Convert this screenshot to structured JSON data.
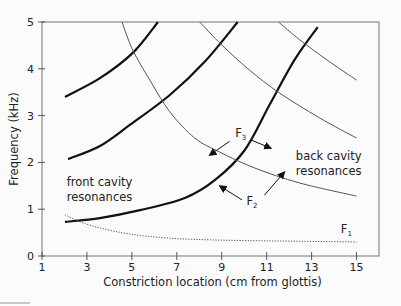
{
  "chart_data": {
    "type": "line",
    "title": "",
    "xlabel": "Constriction location (cm from glottis)",
    "ylabel": "Frequency (kHz)",
    "xlim": [
      1,
      16
    ],
    "ylim": [
      0,
      5
    ],
    "xticks": [
      1,
      3,
      5,
      7,
      9,
      11,
      13,
      15
    ],
    "yticks": [
      0,
      1,
      2,
      3,
      4,
      5
    ],
    "grid": false,
    "legend": null,
    "series": [
      {
        "name": "back cavity resonance 1 (F2 branch, heavy)",
        "style": "heavy",
        "x": [
          2.02,
          3.58,
          5.36,
          7.36,
          8.69,
          10.02,
          11.13,
          12.24,
          13.27
        ],
        "y": [
          0.73,
          0.81,
          0.98,
          1.24,
          1.62,
          2.26,
          3.23,
          4.19,
          4.89
        ]
      },
      {
        "name": "back cavity resonance 2 (heavy)",
        "style": "heavy",
        "x": [
          2.16,
          3.58,
          4.91,
          6.69,
          8.24,
          9.71
        ],
        "y": [
          2.07,
          2.35,
          2.8,
          3.44,
          4.15,
          5.0
        ]
      },
      {
        "name": "back cavity resonance 3 (heavy)",
        "style": "heavy",
        "x": [
          2.02,
          3.58,
          5.04,
          6.16
        ],
        "y": [
          3.4,
          3.8,
          4.34,
          5.0
        ]
      },
      {
        "name": "front cavity resonance 1 (thin)",
        "style": "thin",
        "x": [
          4.56,
          5.04,
          5.8,
          6.69,
          7.8,
          8.91,
          10.47,
          12.47,
          15.0
        ],
        "y": [
          5.0,
          4.4,
          3.76,
          3.08,
          2.52,
          2.22,
          1.88,
          1.56,
          1.28
        ]
      },
      {
        "name": "front cavity resonance 2 (thin)",
        "style": "thin",
        "x": [
          8.02,
          9.0,
          10.24,
          11.58,
          13.36,
          15.0
        ],
        "y": [
          5.0,
          4.51,
          3.97,
          3.48,
          2.95,
          2.52
        ]
      },
      {
        "name": "front cavity resonance 3 (thin)",
        "style": "thin",
        "x": [
          11.53,
          12.47,
          13.8,
          15.0
        ],
        "y": [
          5.0,
          4.62,
          4.15,
          3.76
        ]
      },
      {
        "name": "F1 (Helmholtz)",
        "style": "dotted",
        "x": [
          2.02,
          2.69,
          3.58,
          4.91,
          6.69,
          8.91,
          11.58,
          15.0
        ],
        "y": [
          0.88,
          0.73,
          0.6,
          0.47,
          0.38,
          0.34,
          0.32,
          0.3
        ]
      }
    ],
    "annotations": [
      {
        "id": "front",
        "lines": [
          "front cavity",
          "resonances"
        ],
        "x": 2.1,
        "y": 1.5
      },
      {
        "id": "back",
        "lines": [
          "back cavity",
          "resonances"
        ],
        "x": 12.3,
        "y": 2.05
      },
      {
        "id": "F3",
        "text": "F",
        "sub": "3",
        "x": 9.6,
        "y": 2.55,
        "arrows": [
          {
            "from": [
              9.35,
              2.45
            ],
            "to": [
              8.45,
              2.15
            ]
          },
          {
            "from": [
              10.3,
              2.48
            ],
            "to": [
              11.2,
              2.3
            ]
          }
        ]
      },
      {
        "id": "F2",
        "text": "F",
        "sub": "2",
        "x": 10.1,
        "y": 1.1,
        "arrows": [
          {
            "from": [
              9.9,
              1.2
            ],
            "to": [
              8.9,
              1.5
            ]
          },
          {
            "from": [
              10.9,
              1.3
            ],
            "to": [
              11.8,
              1.8
            ]
          }
        ]
      },
      {
        "id": "F1",
        "text": "F",
        "sub": "1",
        "x": 14.3,
        "y": 0.5
      }
    ]
  }
}
